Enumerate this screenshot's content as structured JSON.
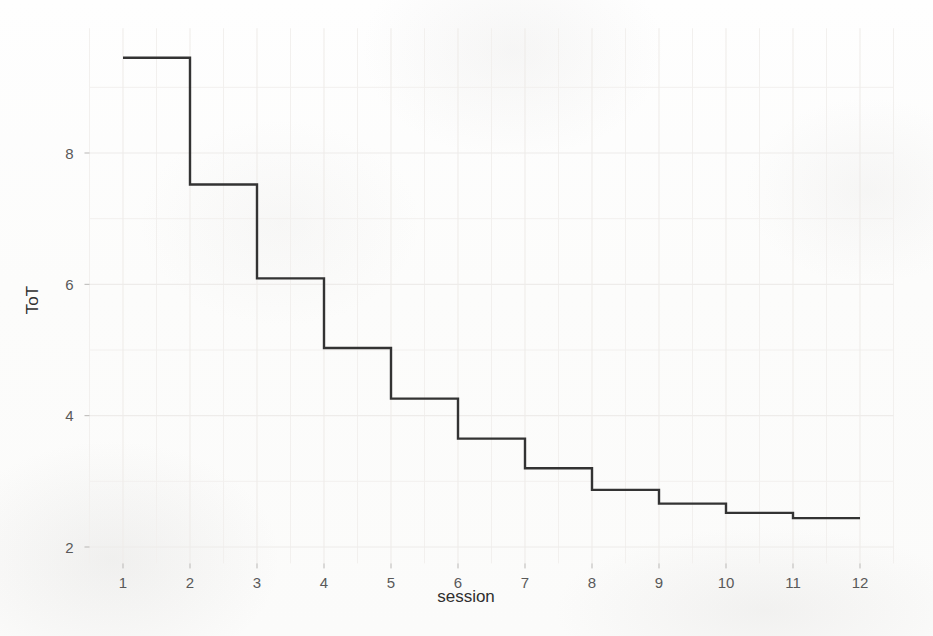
{
  "chart_data": {
    "type": "line",
    "subtype": "step",
    "title": "",
    "xlabel": "session",
    "ylabel": "ToT",
    "x": [
      1,
      2,
      3,
      4,
      5,
      6,
      7,
      8,
      9,
      10,
      11,
      12
    ],
    "values": [
      9.45,
      7.52,
      6.09,
      5.03,
      4.26,
      3.65,
      3.2,
      2.87,
      2.66,
      2.52,
      2.44,
      2.44
    ],
    "series": [
      {
        "name": "ToT",
        "values": [
          9.45,
          7.52,
          6.09,
          5.03,
          4.26,
          3.65,
          3.2,
          2.87,
          2.66,
          2.52,
          2.44,
          2.44
        ]
      }
    ],
    "xtick_labels": [
      "1",
      "2",
      "3",
      "4",
      "5",
      "6",
      "7",
      "8",
      "9",
      "10",
      "11",
      "12"
    ],
    "ytick_labels": [
      "2",
      "4",
      "6",
      "8"
    ],
    "ytick_values": [
      2,
      4,
      6,
      8
    ],
    "xlim": [
      0.5,
      12.5
    ],
    "ylim": [
      1.75,
      9.9
    ],
    "grid": true,
    "grid_minor": true,
    "legend": "none",
    "line_color": "#333333",
    "grid_color": "#eeecea",
    "background_color": "#fdfdfd"
  },
  "axes": {
    "y_title": "ToT",
    "x_title": "session"
  }
}
